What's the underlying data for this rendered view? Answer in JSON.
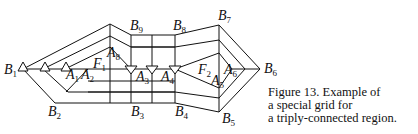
{
  "figure": {
    "caption_lines": [
      "Figure 13. Example of",
      "a special grid for",
      "a triply-connected region."
    ]
  },
  "labels": {
    "B1": {
      "base": "B",
      "sub": "1"
    },
    "B2": {
      "base": "B",
      "sub": "2"
    },
    "B3": {
      "base": "B",
      "sub": "3"
    },
    "B4": {
      "base": "B",
      "sub": "4"
    },
    "B5": {
      "base": "B",
      "sub": "5"
    },
    "B6": {
      "base": "B",
      "sub": "6"
    },
    "B7": {
      "base": "B",
      "sub": "7"
    },
    "B8": {
      "base": "B",
      "sub": "8"
    },
    "B9": {
      "base": "B",
      "sub": "9"
    },
    "A1": {
      "base": "A",
      "sub": "1"
    },
    "A2": {
      "base": "A",
      "sub": "2"
    },
    "A3": {
      "base": "A",
      "sub": "3"
    },
    "A4": {
      "base": "A",
      "sub": "4"
    },
    "A5": {
      "base": "A",
      "sub": "5"
    },
    "A6": {
      "base": "A",
      "sub": "6"
    },
    "A8": {
      "base": "A",
      "sub": "8"
    },
    "F1": {
      "base": "F",
      "sub": "1"
    },
    "F2": {
      "base": "F",
      "sub": "2"
    }
  },
  "markers": {
    "up_triangles": [
      "left-outer",
      "left-middle",
      "left-inner"
    ],
    "down_triangles": [
      "A3-left",
      "A3-right",
      "A4"
    ]
  }
}
